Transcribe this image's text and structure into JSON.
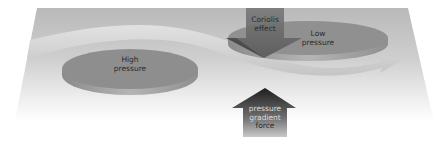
{
  "diagram": {
    "labels": {
      "high_pressure": [
        "High",
        "pressure"
      ],
      "low_pressure": [
        "Low",
        "pressure"
      ],
      "coriolis": [
        "Coriolis",
        "effect"
      ],
      "pressure_gradient": [
        "pressure",
        "gradient",
        "force"
      ]
    },
    "colors": {
      "plane": "#bdbdbd",
      "disc_top": "#8c8c8c",
      "disc_side": "#a8a8a8",
      "band": "#d4d4d4",
      "arrow_dark": "#2e2e2e",
      "arrow_mid": "#6a6a6a"
    }
  }
}
